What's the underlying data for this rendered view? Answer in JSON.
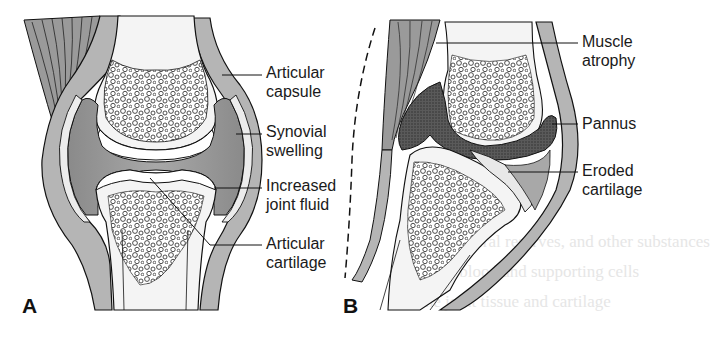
{
  "figure": {
    "panels": [
      {
        "id": "A",
        "label": "A",
        "callouts": [
          {
            "text": "Articular\ncapsule"
          },
          {
            "text": "Synovial\nswelling"
          },
          {
            "text": "Increased\njoint fluid"
          },
          {
            "text": "Articular\ncartilage"
          }
        ]
      },
      {
        "id": "B",
        "label": "B",
        "callouts": [
          {
            "text": "Muscle\natrophy"
          },
          {
            "text": "Pannus"
          },
          {
            "text": "Eroded\ncartilage"
          }
        ]
      }
    ]
  },
  "colors": {
    "tissue_gray": "#b5b5b5",
    "fluid_dark": "#8e8e8e",
    "bone_light": "#f4f4f4",
    "pannus": "#4a4a4a",
    "line": "#111111"
  }
}
